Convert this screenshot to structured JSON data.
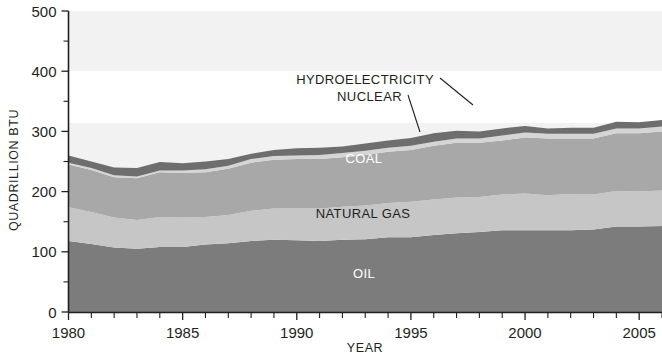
{
  "chart_data": {
    "type": "area",
    "title": "",
    "subtitle": "",
    "xlabel": "YEAR",
    "ylabel": "QUADRILLION BTU",
    "stacked": true,
    "grid": false,
    "legend_position": "inline-labels",
    "xlim": [
      1980,
      2006
    ],
    "ylim": [
      0,
      500
    ],
    "y_ticks_major": [
      0,
      100,
      200,
      300,
      400,
      500
    ],
    "y_ticks_minor": [
      50,
      150,
      250,
      350,
      450
    ],
    "x_ticks_major": [
      1980,
      1985,
      1990,
      1995,
      2000,
      2005
    ],
    "x_tick_labels": [
      "1980",
      "1985",
      "1990",
      "1995",
      "2000",
      "2005"
    ],
    "y_tick_labels": [
      "0",
      "100",
      "200",
      "300",
      "400",
      "500"
    ],
    "x_tick_interval": 1,
    "x": [
      1980,
      1981,
      1982,
      1983,
      1984,
      1985,
      1986,
      1987,
      1988,
      1989,
      1990,
      1991,
      1992,
      1993,
      1994,
      1995,
      1996,
      1997,
      1998,
      1999,
      2000,
      2001,
      2002,
      2003,
      2004,
      2005,
      2006
    ],
    "series": [
      {
        "name": "OIL",
        "label": "OIL",
        "color": "#7c7c7c",
        "label_color": "#ffffff",
        "values": [
          118,
          113,
          107,
          105,
          108,
          108,
          112,
          114,
          118,
          120,
          119,
          118,
          120,
          121,
          124,
          124,
          128,
          131,
          133,
          136,
          136,
          136,
          136,
          137,
          142,
          142,
          143
        ]
      },
      {
        "name": "NATURAL GAS",
        "label": "NATURAL GAS",
        "color": "#c6c6c6",
        "label_color": "#231f20",
        "values": [
          56,
          53,
          50,
          48,
          50,
          49,
          46,
          47,
          50,
          52,
          53,
          54,
          55,
          56,
          57,
          59,
          59,
          59,
          58,
          59,
          61,
          58,
          60,
          58,
          59,
          58,
          59
        ]
      },
      {
        "name": "COAL",
        "label": "COAL",
        "color": "#a8a8a8",
        "label_color": "#ffffff",
        "values": [
          71,
          70,
          67,
          69,
          74,
          74,
          74,
          77,
          80,
          81,
          82,
          82,
          82,
          84,
          85,
          86,
          89,
          91,
          90,
          90,
          93,
          94,
          92,
          93,
          96,
          97,
          98
        ]
      },
      {
        "name": "NUCLEAR",
        "label": "NUCLEAR",
        "color": "#d5d5d5",
        "label_color": "#231f20",
        "values": [
          3,
          3,
          3,
          3,
          3,
          4,
          5,
          5,
          6,
          6,
          6,
          7,
          7,
          7,
          7,
          7,
          7,
          7,
          7,
          8,
          8,
          8,
          8,
          8,
          8,
          8,
          8
        ]
      },
      {
        "name": "HYDROELECTRICITY",
        "label": "HYDROELECTRICITY",
        "color": "#6e6e6e",
        "label_color": "#231f20",
        "values": [
          12,
          11,
          13,
          14,
          14,
          12,
          13,
          11,
          9,
          10,
          12,
          12,
          11,
          12,
          12,
          13,
          14,
          13,
          12,
          12,
          11,
          9,
          10,
          10,
          11,
          10,
          11
        ]
      }
    ],
    "annotations": [
      {
        "text": "HYDROELECTRICITY",
        "anchor_x": 1994.0,
        "anchor_y": 410,
        "leader": true
      },
      {
        "text": "NUCLEAR",
        "anchor_x": 1992.5,
        "anchor_y": 380,
        "leader": true
      },
      {
        "text": "COAL",
        "anchor_x": 1993.0,
        "anchor_y": 278,
        "leader": false
      },
      {
        "text": "NATURAL GAS",
        "anchor_x": 1991.0,
        "anchor_y": 185,
        "leader": false
      },
      {
        "text": "OIL",
        "anchor_x": 1993.5,
        "anchor_y": 78,
        "leader": false
      }
    ]
  },
  "axes": {
    "y_title": "QUADRILLION BTU",
    "x_title": "YEAR"
  },
  "labels": {
    "hydroelectricity": "HYDROELECTRICITY",
    "nuclear": "NUCLEAR",
    "coal": "COAL",
    "natural_gas": "NATURAL GAS",
    "oil": "OIL"
  },
  "colors": {
    "oil": "#7c7c7c",
    "natural_gas": "#c6c6c6",
    "coal": "#a8a8a8",
    "nuclear": "#d5d5d5",
    "hydroelectricity": "#6e6e6e",
    "background": "#ffffff",
    "axis": "#231f20"
  }
}
